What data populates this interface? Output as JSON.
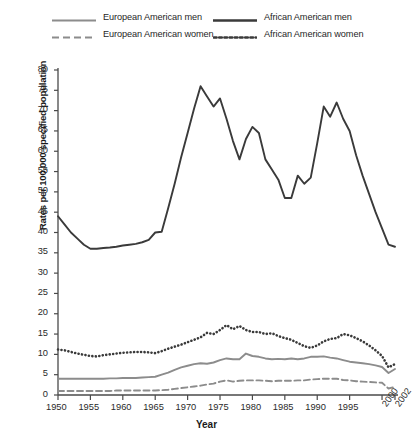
{
  "figure": {
    "background": "#ffffff",
    "axis_color": "#4a4a4a"
  },
  "legend": {
    "position": "top",
    "entries": [
      {
        "label": "European American men",
        "color": "#8c8c8c",
        "style": "solid",
        "icon": "line-solid-gray-icon"
      },
      {
        "label": "European American women",
        "color": "#8c8c8c",
        "style": "dashed",
        "icon": "line-dashed-gray-icon"
      },
      {
        "label": "African American men",
        "color": "#3a3a3a",
        "style": "solid",
        "icon": "line-solid-dark-icon"
      },
      {
        "label": "African American women",
        "color": "#3a3a3a",
        "style": "dotted",
        "icon": "line-dotted-dark-icon"
      }
    ]
  },
  "chart_data": {
    "type": "line",
    "title": "",
    "xlabel": "Year",
    "ylabel": "Rates per 100,000 specified population",
    "xlim": [
      1950,
      2002
    ],
    "ylim": [
      0,
      80
    ],
    "ytick_step": 5,
    "yticks": [
      0,
      5,
      10,
      15,
      20,
      25,
      30,
      35,
      40,
      45,
      50,
      55,
      60,
      65,
      70,
      75,
      80
    ],
    "xticks": [
      1950,
      1955,
      1960,
      1965,
      1970,
      1975,
      1980,
      1985,
      1990,
      1995,
      2000,
      2002
    ],
    "xticks_rotated": [
      2000,
      2002
    ],
    "grid": false,
    "legend_position": "top",
    "x": [
      1950,
      1951,
      1952,
      1953,
      1954,
      1955,
      1956,
      1957,
      1958,
      1959,
      1960,
      1961,
      1962,
      1963,
      1964,
      1965,
      1966,
      1967,
      1968,
      1969,
      1970,
      1971,
      1972,
      1973,
      1974,
      1975,
      1976,
      1977,
      1978,
      1979,
      1980,
      1981,
      1982,
      1983,
      1984,
      1985,
      1986,
      1987,
      1988,
      1989,
      1990,
      1991,
      1992,
      1993,
      1994,
      1995,
      1996,
      1997,
      1998,
      1999,
      2000,
      2001,
      2002
    ],
    "series": [
      {
        "name": "African American men",
        "color": "#3a3a3a",
        "style": "solid",
        "values": [
          44.0,
          42.0,
          40.0,
          38.5,
          37.0,
          36.0,
          36.0,
          36.2,
          36.3,
          36.5,
          36.8,
          37.0,
          37.2,
          37.6,
          38.2,
          40.0,
          40.2,
          46.0,
          52.0,
          58.5,
          64.5,
          70.5,
          76.0,
          73.5,
          71.0,
          73.0,
          68.0,
          62.5,
          58.0,
          63.0,
          66.0,
          64.5,
          58.0,
          55.5,
          53.0,
          48.5,
          48.5,
          54.0,
          52.0,
          53.5,
          62.0,
          71.0,
          68.5,
          72.0,
          68.0,
          65.0,
          59.0,
          54.0,
          49.5,
          45.0,
          41.0,
          37.0,
          36.5
        ]
      },
      {
        "name": "African American women",
        "color": "#3a3a3a",
        "style": "dotted",
        "values": [
          11.2,
          11.0,
          10.6,
          10.2,
          9.9,
          9.6,
          9.5,
          9.8,
          10.0,
          10.2,
          10.4,
          10.5,
          10.6,
          10.6,
          10.5,
          10.3,
          10.8,
          11.4,
          11.9,
          12.4,
          13.0,
          13.6,
          14.2,
          15.3,
          15.0,
          16.0,
          17.2,
          16.2,
          17.0,
          16.0,
          15.5,
          15.5,
          15.0,
          15.2,
          14.5,
          14.0,
          13.6,
          12.8,
          12.0,
          11.6,
          12.2,
          13.2,
          13.8,
          14.0,
          15.0,
          14.7,
          14.0,
          13.2,
          12.2,
          11.0,
          9.6,
          6.8,
          7.6
        ]
      },
      {
        "name": "European American men",
        "color": "#8c8c8c",
        "style": "solid",
        "values": [
          4.0,
          4.0,
          4.0,
          4.0,
          4.0,
          4.0,
          4.0,
          4.0,
          4.1,
          4.1,
          4.2,
          4.2,
          4.2,
          4.3,
          4.4,
          4.5,
          5.0,
          5.5,
          6.2,
          6.8,
          7.2,
          7.6,
          7.8,
          7.7,
          8.0,
          8.6,
          9.0,
          8.8,
          8.8,
          10.2,
          9.6,
          9.4,
          9.0,
          8.8,
          8.9,
          8.8,
          9.0,
          8.8,
          9.0,
          9.4,
          9.4,
          9.5,
          9.2,
          9.0,
          8.6,
          8.2,
          8.0,
          7.8,
          7.6,
          7.3,
          6.9,
          5.4,
          6.4
        ]
      },
      {
        "name": "European American women",
        "color": "#8c8c8c",
        "style": "dashed",
        "values": [
          1.0,
          1.0,
          1.0,
          1.0,
          1.0,
          1.0,
          1.0,
          1.0,
          1.0,
          1.1,
          1.1,
          1.1,
          1.1,
          1.1,
          1.1,
          1.1,
          1.2,
          1.3,
          1.5,
          1.7,
          1.9,
          2.1,
          2.3,
          2.6,
          2.8,
          3.3,
          3.6,
          3.3,
          3.5,
          3.6,
          3.6,
          3.6,
          3.5,
          3.4,
          3.5,
          3.5,
          3.5,
          3.6,
          3.6,
          3.8,
          3.9,
          4.0,
          4.0,
          4.0,
          3.7,
          3.6,
          3.4,
          3.3,
          3.2,
          3.1,
          3.0,
          1.6,
          2.0
        ]
      }
    ]
  }
}
